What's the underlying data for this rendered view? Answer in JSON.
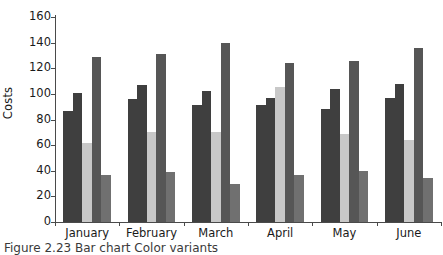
{
  "chart_data": {
    "type": "bar",
    "title": "",
    "xlabel": "",
    "ylabel": "Costs",
    "ylim": [
      0,
      160
    ],
    "yticks": [
      0,
      20,
      40,
      60,
      80,
      100,
      120,
      140,
      160
    ],
    "grid": false,
    "legend": "none",
    "categories": [
      "January",
      "February",
      "March",
      "April",
      "May",
      "June"
    ],
    "series": [
      {
        "name": "series-1",
        "color": "#3f3f3f",
        "values": [
          87,
          96,
          91,
          91,
          88,
          97
        ]
      },
      {
        "name": "series-2",
        "color": "#3f3f3f",
        "values": [
          101,
          107,
          102,
          97,
          104,
          108
        ]
      },
      {
        "name": "series-3",
        "color": "#c8c8c8",
        "values": [
          62,
          70,
          70,
          105,
          69,
          64
        ]
      },
      {
        "name": "series-4",
        "color": "#565656",
        "values": [
          129,
          131,
          140,
          124,
          126,
          136
        ]
      },
      {
        "name": "series-5",
        "color": "#707070",
        "values": [
          37,
          39,
          30,
          37,
          40,
          34
        ]
      }
    ]
  },
  "axis": {
    "ylabel": "Costs",
    "ytick_labels": [
      "160",
      "140",
      "120",
      "100",
      "80",
      "60",
      "40",
      "20",
      "0"
    ],
    "xtick_labels": [
      "January",
      "February",
      "March",
      "April",
      "May",
      "June"
    ]
  },
  "caption": {
    "text": "Figure 2.23  Bar chart",
    "visible_fragment": "Figure   2.23  Bar chart     Color variants"
  },
  "colors": {
    "bar_dark": "#3f3f3f",
    "bar_mid_dark": "#565656",
    "bar_mid": "#707070",
    "bar_light": "#c8c8c8",
    "axis": "#4a4a4a",
    "text": "#1a1a1a",
    "background": "#ffffff"
  }
}
